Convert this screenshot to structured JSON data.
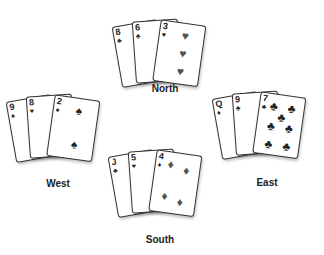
{
  "hands": {
    "north": {
      "label": "North",
      "cards": [
        {
          "rank": "8",
          "suit": "♣"
        },
        {
          "rank": "6",
          "suit": "♣"
        },
        {
          "rank": "3",
          "suit": "♥"
        }
      ]
    },
    "west": {
      "label": "West",
      "cards": [
        {
          "rank": "9",
          "suit": "♠"
        },
        {
          "rank": "8",
          "suit": "♥"
        },
        {
          "rank": "2",
          "suit": "♠"
        }
      ]
    },
    "east": {
      "label": "East",
      "cards": [
        {
          "rank": "Q",
          "suit": "♦"
        },
        {
          "rank": "9",
          "suit": "♣"
        },
        {
          "rank": "7",
          "suit": "♣"
        }
      ]
    },
    "south": {
      "label": "South",
      "cards": [
        {
          "rank": "J",
          "suit": "♣"
        },
        {
          "rank": "5",
          "suit": "♥"
        },
        {
          "rank": "4",
          "suit": "♦"
        }
      ]
    }
  }
}
